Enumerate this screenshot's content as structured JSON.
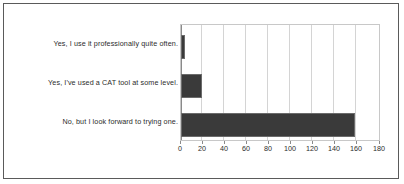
{
  "chart_data": {
    "type": "bar",
    "orientation": "horizontal",
    "title": "",
    "subtitle": "",
    "xlabel": "",
    "ylabel": "",
    "categories": [
      "Yes, I use it professionally quite often.",
      "Yes, I've used a CAT tool at some level.",
      "No, but I look forward to trying one."
    ],
    "values": [
      4,
      19,
      158
    ],
    "xlim": [
      0,
      180
    ],
    "xticks": [
      0,
      20,
      40,
      60,
      80,
      100,
      120,
      140,
      160,
      180
    ],
    "xtick_labels": [
      "0",
      "20",
      "40",
      "60",
      "80",
      "100",
      "120",
      "140",
      "160",
      "180"
    ],
    "grid": true,
    "grid_axis": "x",
    "legend": false,
    "legend_position": "none",
    "bar_color": "#3a3a3a",
    "bar_edge_color": "#6b6b6b",
    "gridline_color": "#d4d4d4",
    "axis_color": "#8a8a8a",
    "plot_background": "#ffffff",
    "frame_color": "#5a5a5a",
    "series": [
      {
        "name": "Responses",
        "values": [
          4,
          19,
          158
        ]
      }
    ]
  }
}
